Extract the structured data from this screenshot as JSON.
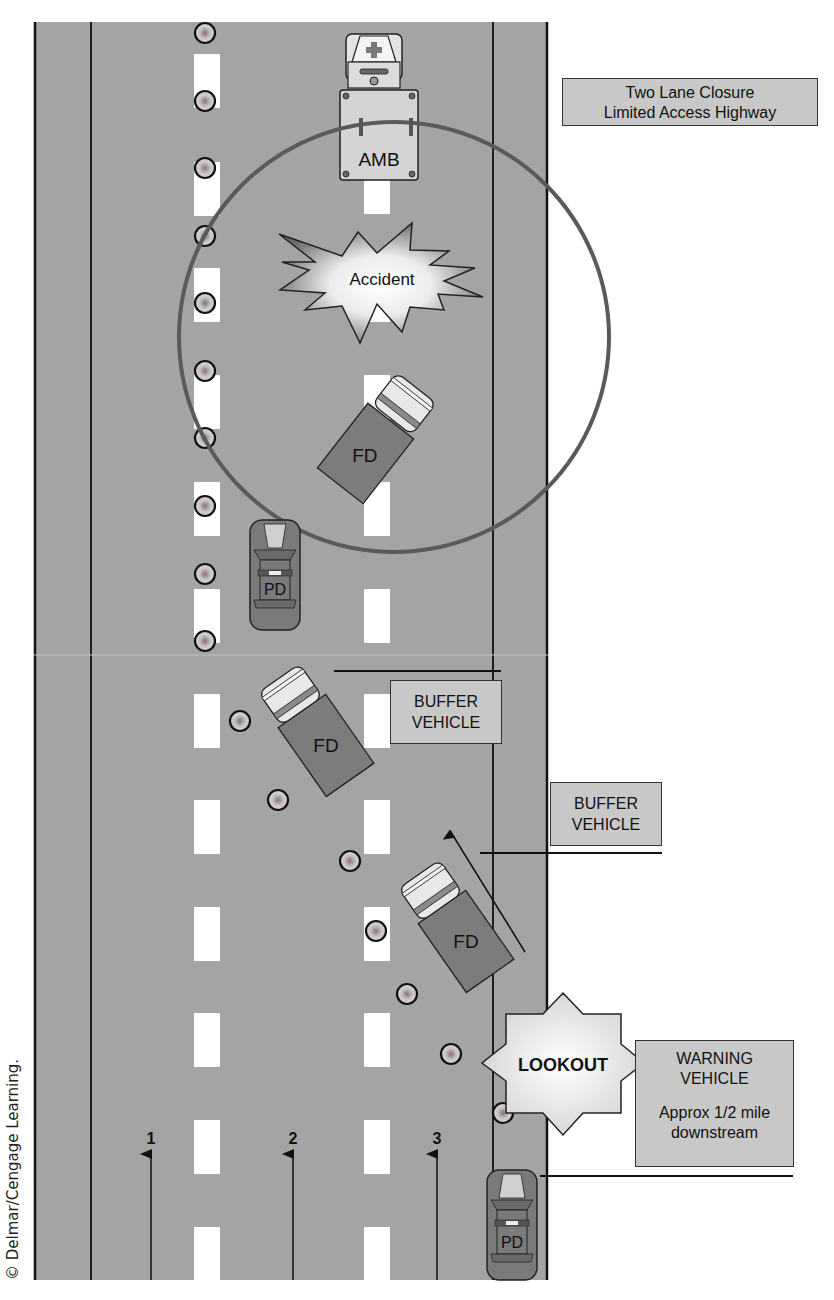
{
  "title_box": {
    "line1": "Two Lane Closure",
    "line2": "Limited Access Highway"
  },
  "incident": {
    "label": "Accident"
  },
  "vehicles": {
    "ambulance": {
      "label": "AMB"
    },
    "fire_engine_scene": {
      "label": "FD"
    },
    "police_car_scene": {
      "label": "PD"
    },
    "fire_engine_buffer_1": {
      "label": "FD"
    },
    "fire_engine_buffer_2": {
      "label": "FD"
    },
    "police_car_warning": {
      "label": "PD"
    }
  },
  "callouts": {
    "buffer_vehicle_1": {
      "line1": "BUFFER",
      "line2": "VEHICLE"
    },
    "buffer_vehicle_2": {
      "line1": "BUFFER",
      "line2": "VEHICLE"
    },
    "lookout": {
      "label": "LOOKOUT"
    },
    "warning_vehicle": {
      "line1": "WARNING",
      "line2": "VEHICLE",
      "line3": "Approx 1/2 mile",
      "line4": "downstream"
    }
  },
  "lanes": [
    {
      "number": "1"
    },
    {
      "number": "2"
    },
    {
      "number": "3"
    }
  ],
  "copyright": "© Delmar/Cengage Learning.",
  "colors": {
    "road": "#a4a4a4",
    "shoulder_line": "#111111",
    "lane_dash": "#ffffff",
    "vehicle_body": "#7c7c7c",
    "vehicle_cab": "#e6e6e6",
    "label_box": "#c8c8c8",
    "zone_circle": "#5a5a5a"
  }
}
